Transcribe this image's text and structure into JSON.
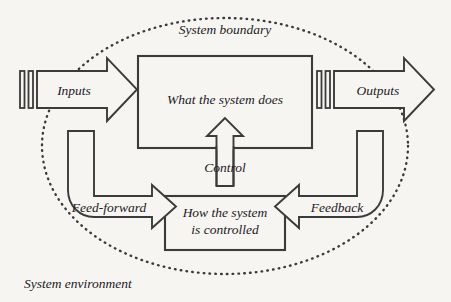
{
  "diagram": {
    "title": "System boundary",
    "environment_label": "System environment",
    "boundary": {
      "label": "System boundary",
      "style": "dotted-ellipse",
      "color": "#3b3b3b"
    },
    "colors": {
      "background": "#f6f5f2",
      "stroke": "#3b3b3b",
      "text": "#23201e"
    },
    "nodes": [
      {
        "id": "system-process",
        "label": "What the system does",
        "shape": "rectangle"
      },
      {
        "id": "system-control",
        "label_line1": "How the system",
        "label_line2": "is controlled",
        "shape": "rectangle"
      }
    ],
    "flows": [
      {
        "id": "inputs",
        "label": "Inputs",
        "shape": "block-arrow-right",
        "direction": "right"
      },
      {
        "id": "outputs",
        "label": "Outputs",
        "shape": "block-arrow-right",
        "direction": "right"
      },
      {
        "id": "feed-forward",
        "label": "Feed-forward",
        "shape": "bent-block-arrow",
        "direction": "down-right"
      },
      {
        "id": "feedback",
        "label": "Feedback",
        "shape": "bent-block-arrow",
        "direction": "down-left"
      },
      {
        "id": "control",
        "label": "Control",
        "shape": "block-arrow-up",
        "direction": "up"
      }
    ]
  }
}
